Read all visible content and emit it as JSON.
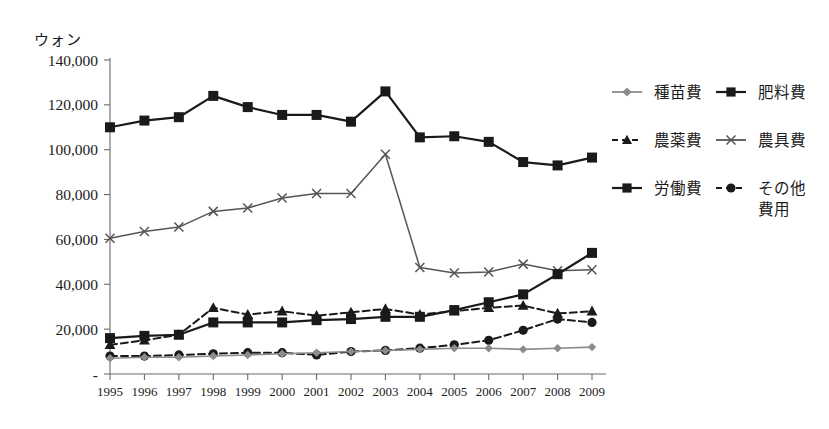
{
  "axis": {
    "unit_label": "ウォン",
    "y_ticks": [
      "140,000",
      "120,000",
      "100,000",
      "80,000",
      "60,000",
      "40,000",
      "20,000",
      "-"
    ],
    "y_tick_values": [
      140000,
      120000,
      100000,
      80000,
      60000,
      40000,
      20000,
      0
    ],
    "x_ticks": [
      "1995",
      "1996",
      "1997",
      "1998",
      "1999",
      "2000",
      "2001",
      "2002",
      "2003",
      "2004",
      "2005",
      "2006",
      "2007",
      "2008",
      "2009"
    ]
  },
  "legend": {
    "entries": [
      {
        "label": "種苗費",
        "marker": "diamond",
        "dash": "solid",
        "color": "#8c8c8c"
      },
      {
        "label": "肥料費",
        "marker": "square",
        "dash": "solid",
        "color": "#1a1a1a"
      },
      {
        "label": "農薬費",
        "marker": "triangle",
        "dash": "dashed",
        "color": "#1a1a1a"
      },
      {
        "label": "農具費",
        "marker": "x",
        "dash": "solid",
        "color": "#555555"
      },
      {
        "label": "労働費",
        "marker": "square",
        "dash": "solid",
        "color": "#1a1a1a"
      },
      {
        "label": "その他費用",
        "marker": "circle",
        "dash": "dashed",
        "color": "#1a1a1a"
      }
    ]
  },
  "caption": {
    "text": ""
  },
  "chart_data": {
    "type": "line",
    "title": "",
    "xlabel": "",
    "ylabel": "ウォン",
    "ylim": [
      0,
      140000
    ],
    "ytick_step": 20000,
    "grid": false,
    "legend_position": "right",
    "x": [
      "1995",
      "1996",
      "1997",
      "1998",
      "1999",
      "2000",
      "2001",
      "2002",
      "2003",
      "2004",
      "2005",
      "2006",
      "2007",
      "2008",
      "2009"
    ],
    "series": [
      {
        "name": "労働費",
        "marker": "square",
        "dash": "solid",
        "color": "#1a1a1a",
        "line_width": 2.2,
        "marker_size": 5.0,
        "values": [
          110000,
          113000,
          114500,
          124000,
          119000,
          115500,
          115500,
          112500,
          126000,
          105500,
          106000,
          103500,
          94500,
          93000,
          96500
        ]
      },
      {
        "name": "農具費",
        "marker": "x",
        "dash": "solid",
        "color": "#555555",
        "line_width": 1.5,
        "marker_size": 4.5,
        "values": [
          60500,
          63500,
          65500,
          72500,
          74000,
          78500,
          80500,
          80500,
          98000,
          47500,
          45000,
          45500,
          49000,
          46000,
          46500
        ]
      },
      {
        "name": "肥料費",
        "marker": "square",
        "dash": "solid",
        "color": "#1a1a1a",
        "line_width": 2.2,
        "marker_size": 5.0,
        "values": [
          16000,
          17000,
          17500,
          23000,
          23000,
          23000,
          24000,
          24500,
          25500,
          25500,
          28500,
          32000,
          35500,
          44500,
          54000
        ]
      },
      {
        "name": "農薬費",
        "marker": "triangle",
        "dash": "dashed",
        "color": "#1a1a1a",
        "line_width": 2.0,
        "marker_size": 5.0,
        "values": [
          13000,
          15000,
          17500,
          29500,
          26500,
          28000,
          26000,
          27500,
          29000,
          26500,
          28000,
          29500,
          30500,
          27000,
          28000
        ]
      },
      {
        "name": "その他費用",
        "marker": "circle",
        "dash": "dashed",
        "color": "#1a1a1a",
        "line_width": 2.0,
        "marker_size": 4.6,
        "values": [
          8000,
          8000,
          8500,
          9000,
          9500,
          9500,
          8500,
          10000,
          10500,
          11500,
          13000,
          15000,
          19500,
          24500,
          23000
        ]
      },
      {
        "name": "種苗費",
        "marker": "diamond",
        "dash": "solid",
        "color": "#8c8c8c",
        "line_width": 1.6,
        "marker_size": 4.2,
        "values": [
          7000,
          7500,
          7500,
          8000,
          8500,
          9000,
          9500,
          10000,
          10500,
          11000,
          11500,
          11500,
          11000,
          11500,
          12000
        ]
      }
    ]
  }
}
